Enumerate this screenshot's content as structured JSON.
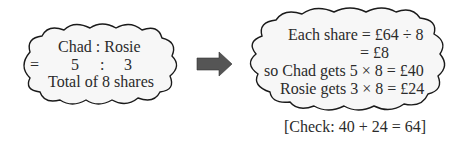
{
  "left_cloud": {
    "header": "Chad : Rosie",
    "equals": "=",
    "ratio_left": "5",
    "ratio_colon": ":",
    "ratio_right": "3",
    "total": "Total of 8 shares"
  },
  "arrow": {
    "icon": "right-arrow-icon",
    "color": "#555555"
  },
  "right_cloud": {
    "line1": "Each share = £64 ÷ 8",
    "line2": "= £8",
    "line3": "so Chad gets 5 × 8 = £40",
    "line4": "Rosie gets 3 × 8 = £24"
  },
  "check": "[Check: 40 + 24 = 64]",
  "colors": {
    "cloud_fill": "#f7f7f7",
    "cloud_stroke": "#1a1a1a"
  }
}
